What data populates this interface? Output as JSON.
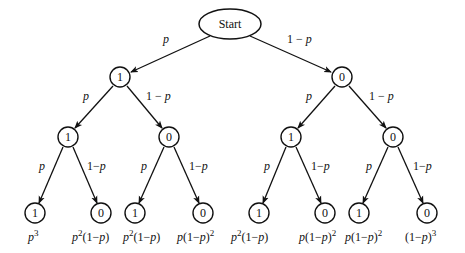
{
  "diagram": {
    "type": "probability-tree",
    "root": {
      "label": "Start"
    },
    "edge_labels": {
      "left": "p",
      "right": "1 − p"
    },
    "level1": [
      {
        "label": "1"
      },
      {
        "label": "0"
      }
    ],
    "level2": [
      {
        "label": "1"
      },
      {
        "label": "0"
      },
      {
        "label": "1"
      },
      {
        "label": "0"
      }
    ],
    "level3": [
      {
        "label": "1",
        "prob": "p^3"
      },
      {
        "label": "0",
        "prob": "p^2(1-p)"
      },
      {
        "label": "1",
        "prob": "p^2(1-p)"
      },
      {
        "label": "0",
        "prob": "p(1-p)^2"
      },
      {
        "label": "1",
        "prob": "p^2(1-p)"
      },
      {
        "label": "0",
        "prob": "p(1-p)^2"
      },
      {
        "label": "1",
        "prob": "p(1-p)^2"
      },
      {
        "label": "0",
        "prob": "(1-p)^3"
      }
    ],
    "text": {
      "p": "p",
      "one_minus": "1 − ",
      "one_minus_tight": "1−",
      "lparen": "(",
      "rparen": ")",
      "one": "1",
      "exp2": "2",
      "exp3": "3"
    }
  }
}
